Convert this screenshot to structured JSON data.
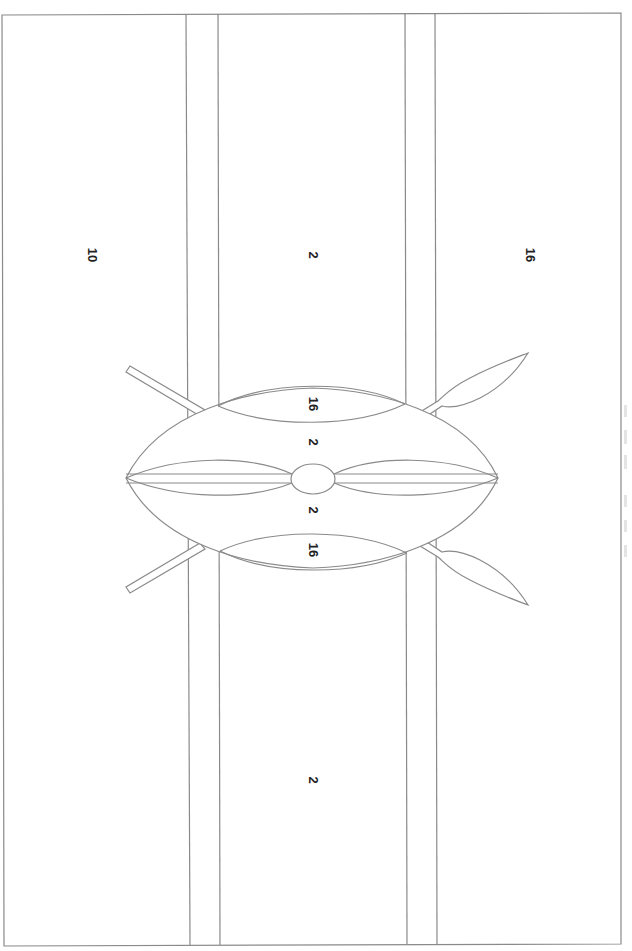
{
  "page": {
    "orientation": "rotated 90 degrees"
  },
  "regions": {
    "stripe_top": {
      "label": "10",
      "x": 92,
      "y": 255
    },
    "stripe_middle_upper": {
      "label": "2",
      "x": 313,
      "y": 255
    },
    "stripe_bottom": {
      "label": "16",
      "x": 530,
      "y": 255
    },
    "stripe_middle_lower": {
      "label": "2",
      "x": 313,
      "y": 780
    },
    "shield_upper_band": {
      "label": "16",
      "x": 313,
      "y": 404
    },
    "shield_upper_center": {
      "label": "2",
      "x": 313,
      "y": 442
    },
    "shield_lower_center": {
      "label": "2",
      "x": 313,
      "y": 510
    },
    "shield_lower_band": {
      "label": "16",
      "x": 313,
      "y": 550
    }
  },
  "colors": {
    "outline": "#8a8a8a",
    "label": "#222222",
    "background": "#ffffff"
  }
}
